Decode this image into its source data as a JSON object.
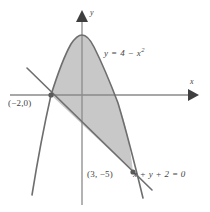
{
  "figure": {
    "background_color": "#ffffff",
    "stroke_color": "#6e6e6e",
    "axis_color": "#8a8a8a",
    "shade_color": "#c8c8c8",
    "text_color": "#444444"
  },
  "axes": {
    "x_label": "x",
    "y_label": "y",
    "x_axis_pixel_y": 95,
    "y_axis_pixel_x": 82,
    "x_arrow_tip_x": 197,
    "y_arrow_tip_y": 11
  },
  "curves": {
    "parabola": {
      "equation_label": "y = 4 − x",
      "exponent": "2",
      "vertex": [
        0,
        4
      ],
      "roots": [
        -2,
        2
      ]
    },
    "line": {
      "equation_label": "x + y + 2 = 0",
      "slope": -1,
      "intercept": -2
    }
  },
  "points": [
    {
      "name": "left-intersection",
      "label": "(−2,0)",
      "x": -2,
      "y": 0
    },
    {
      "name": "right-intersection",
      "label": "(3, −5)",
      "x": 3,
      "y": -5
    }
  ],
  "shaded_region": {
    "description": "Area between the parabola and the line",
    "from_x": -2,
    "to_x": 3
  }
}
